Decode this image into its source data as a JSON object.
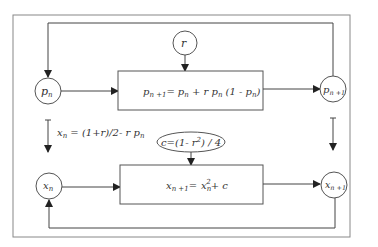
{
  "diagram": {
    "nodes": {
      "p_n": {
        "base": "p",
        "sub": "n"
      },
      "r": {
        "label": "r"
      },
      "p_n1": {
        "base": "p",
        "sub": "n +1"
      },
      "x_n": {
        "base": "x",
        "sub": "n"
      },
      "x_n1": {
        "base": "x",
        "sub": "n +1"
      }
    },
    "boxes": {
      "logistic": {
        "lhs_base": "p",
        "lhs_sub": "n +1",
        "eq": "=",
        "t1_base": "p",
        "t1_sub": "n",
        "plus": " + r ",
        "t2_base": "p",
        "t2_sub": "n",
        "paren_open": " (1 - ",
        "t3_base": "p",
        "t3_sub": "n",
        "paren_close": ")"
      },
      "quadratic": {
        "lhs_base": "x",
        "lhs_sub": "n +1",
        "eq": "=",
        "t1_base": "x",
        "t1_sub": "n",
        "t1_sup": "2",
        "rest": "+ c"
      }
    },
    "ellipse": {
      "prefix": "c=(1- r",
      "sup": "2",
      "suffix": ") / 4"
    },
    "transform": {
      "lhs_base": "x",
      "lhs_sub": "n",
      "rhs": " = (1+r)/2- r  p",
      "rhs_sub": "n"
    },
    "colors": {
      "stroke": "#555555",
      "frame": "#888888",
      "text": "#333333"
    }
  }
}
